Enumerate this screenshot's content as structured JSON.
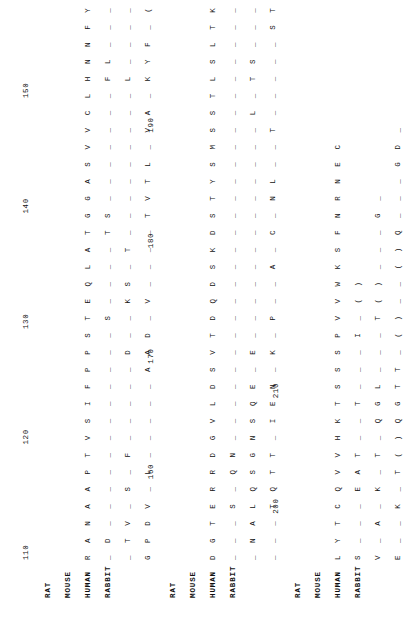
{
  "figure": {
    "kind": "multiple-sequence-alignment",
    "orientation": "rotated-90-ccw",
    "species_order": [
      "RAT",
      "MOUSE",
      "HUMAN",
      "RABBIT"
    ],
    "gap_character": "_",
    "identity_convention": "blank/underline means identical to RAT reference"
  },
  "labels": {
    "rat": "RAT",
    "mouse": "MOUSE",
    "human": "HUMAN",
    "rabbit": "RABBIT"
  },
  "blocks": [
    {
      "id": "block-1",
      "ruler": [
        {
          "value": "110",
          "offset": 0
        },
        {
          "value": "120",
          "offset": 10
        },
        {
          "value": "130",
          "offset": 20
        },
        {
          "value": "140",
          "offset": 30
        },
        {
          "value": "150",
          "offset": 40
        }
      ],
      "rows": [
        {
          "species": "RAT",
          "seq": "R A N A A P T V S I F P P S T E Q L A T G G A S V V C L H N N F Y P R D I S V K W K I"
        },
        {
          "species": "MOUSE",
          "seq": "_ D _ _ _ _ _ _ _ _ _ _ _ _ S _ _ _ _ T S _ _ _ _ _ _ _ F L _ _ _ _ _ K _ _ M _ _ _"
        },
        {
          "species": "HUMAN",
          "seq": "_ T V _ S _ F _ _ _ _ _ D _ _ K S _ T _ _ _ _ _ _ _ _ _ L _ _ _ _ _ E A K _ Q _ _ V"
        },
        {
          "species": "RABBIT",
          "seq": "G P D V _ L _ _ _ _ _ A A D _ V _ _ _ _ T V T L _ V A _ K Y F _ ( ) _ V T _ T _ E V"
        }
      ]
    },
    {
      "id": "block-2",
      "ruler": [
        {
          "value": "160",
          "offset": 7
        },
        {
          "value": "170",
          "offset": 17
        },
        {
          "value": "180",
          "offset": 27
        },
        {
          "value": "190",
          "offset": 37
        }
      ],
      "rows": [
        {
          "species": "RAT",
          "seq": "D G T E R R D G V L D S V T D Q D S K D S T Y S M S S T L S L T K A D Y E S H N"
        },
        {
          "species": "MOUSE",
          "seq": "_ _ _ S _ Q N _ _ _ _ _ _ _ _ _ _ _ _ _ _ _ _ _ _ _ _ _ _ _ _ _ _ V E _ R _"
        },
        {
          "species": "HUMAN",
          "seq": "_ N A L Q S G N S Q E _ E _ _ _ _ _ _ _ _ _ _ _ _ _ L _ T S _ _ _ _ E K _ K"
        },
        {
          "species": "RABBIT",
          "seq": "_ _ _ T Q T T _ I E N _ K _ P _ _ A _ C _ N L _ _ T _ _ _ _ _ S T Q _ N _ K"
        }
      ]
    },
    {
      "id": "block-3",
      "ruler": [
        {
          "value": "200",
          "offset": 4
        },
        {
          "value": "210",
          "offset": 14
        }
      ],
      "rows": [
        {
          "species": "RAT",
          "seq": "L Y T C Q V V H K T S S S P V V W K S F N R N E C"
        },
        {
          "species": "MOUSE",
          "seq": "S _ _ _ E A T _ _ T _ _ _ I _ ( )"
        },
        {
          "species": "HUMAN",
          "seq": "V _ A _ K _ T _ Q G L _ _ _ T ( ) _ _ _ G _"
        },
        {
          "species": "RABBIT",
          "seq": "E _ _ K _ T ( ) Q G T T _ ( ) _ _ ( ) Q _ _ _ G D _"
        }
      ]
    }
  ]
}
